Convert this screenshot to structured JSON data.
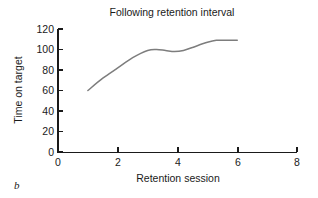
{
  "panel": {
    "letter": "b"
  },
  "chart_data": {
    "type": "line",
    "title": "Following retention interval",
    "xlabel": "Retention session",
    "ylabel": "Time on target",
    "xlim": [
      0,
      8
    ],
    "ylim": [
      0,
      120
    ],
    "xticks": [
      0,
      2,
      4,
      6,
      8
    ],
    "xtick_labels": [
      "0",
      "2",
      "4",
      "6",
      "8"
    ],
    "xminor_ticks": [
      1,
      3,
      5,
      7
    ],
    "yticks": [
      0,
      20,
      40,
      60,
      80,
      100,
      120
    ],
    "ytick_labels": [
      "0",
      "20",
      "40",
      "60",
      "80",
      "100",
      "120"
    ],
    "grid": false,
    "legend": false,
    "series": [
      {
        "name": "Time on target",
        "color": "#7d7d7d",
        "x": [
          1.0,
          1.5,
          2.0,
          2.5,
          3.0,
          3.3,
          3.6,
          3.9,
          4.2,
          4.5,
          5.0,
          5.3,
          5.6,
          6.0
        ],
        "y": [
          60,
          72,
          82,
          92,
          99,
          100,
          99,
          98,
          99,
          102,
          107,
          109,
          109,
          109
        ]
      }
    ]
  }
}
